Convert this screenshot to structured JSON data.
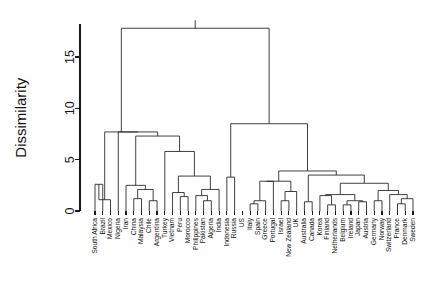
{
  "chart_data": {
    "type": "dendrogram",
    "title": "",
    "xlabel": "",
    "ylabel": "Dissimilarity",
    "ylim": [
      0,
      17.8
    ],
    "yticks": [
      0,
      5,
      10,
      15
    ],
    "ytick_labels": [
      "0",
      "5",
      "10",
      "15"
    ],
    "grid": false,
    "legend": "none",
    "leaf_order": [
      "South Africa",
      "Brazil",
      "Mexico",
      "Nigeria",
      "Iran",
      "China",
      "Malaysia",
      "Chile",
      "Argentina",
      "Turkey",
      "Vietnam",
      "Peru",
      "Morocco",
      "Philippines",
      "Pakistan",
      "Algeria",
      "India",
      "Indonesia",
      "Russia",
      "US",
      "Italy",
      "Spain",
      "Greece",
      "Portugal",
      "Israel",
      "New Zealand",
      "UK",
      "Australia",
      "Canada",
      "Korea",
      "Finland",
      "Netherlands",
      "Belgium",
      "Ireland",
      "Japan",
      "Austria",
      "Germany",
      "Norway",
      "Switzerland",
      "France",
      "Denmark",
      "Sweden"
    ],
    "leaf_count": 42,
    "merges": [
      {
        "id": "m1",
        "left": "South Africa",
        "right": "Brazil",
        "height": 2.6
      },
      {
        "id": "m2",
        "left": "Mexico",
        "right": "m1",
        "height": 1.1
      },
      {
        "id": "m3",
        "left": "China",
        "right": "Malaysia",
        "height": 1.2
      },
      {
        "id": "m4",
        "left": "Chile",
        "right": "Argentina",
        "height": 1.0
      },
      {
        "id": "m5",
        "left": "m3",
        "right": "m4",
        "height": 2.1
      },
      {
        "id": "m6",
        "left": "Iran",
        "right": "m5",
        "height": 2.5
      },
      {
        "id": "m7",
        "left": "Peru",
        "right": "Morocco",
        "height": 1.4
      },
      {
        "id": "m8",
        "left": "Vietnam",
        "right": "m7",
        "height": 1.8
      },
      {
        "id": "m9",
        "left": "Pakistan",
        "right": "Algeria",
        "height": 1.0
      },
      {
        "id": "m10",
        "left": "Philippines",
        "right": "m9",
        "height": 1.5
      },
      {
        "id": "m11",
        "left": "m10",
        "right": "India",
        "height": 2.1
      },
      {
        "id": "m12",
        "left": "m8",
        "right": "m11",
        "height": 3.4
      },
      {
        "id": "m13",
        "left": "Turkey",
        "right": "m12",
        "height": 5.8
      },
      {
        "id": "m14",
        "left": "m6",
        "right": "m13",
        "height": 7.3
      },
      {
        "id": "m15",
        "left": "Nigeria",
        "right": "m14",
        "height": 7.7
      },
      {
        "id": "m16",
        "left": "m2",
        "right": "m15",
        "height": 7.7
      },
      {
        "id": "m17",
        "left": "Indonesia",
        "right": "Russia",
        "height": 3.3
      },
      {
        "id": "m18",
        "left": "Italy",
        "right": "Spain",
        "height": 0.7
      },
      {
        "id": "m19",
        "left": "m18",
        "right": "Greece",
        "height": 1.0
      },
      {
        "id": "m20",
        "left": "m19",
        "right": "Portugal",
        "height": 2.9
      },
      {
        "id": "m21",
        "left": "Israel",
        "right": "New Zealand",
        "height": 1.0
      },
      {
        "id": "m22",
        "left": "m21",
        "right": "UK",
        "height": 1.9
      },
      {
        "id": "m23",
        "left": "m20",
        "right": "m22",
        "height": 2.9
      },
      {
        "id": "m24",
        "left": "Australia",
        "right": "Canada",
        "height": 0.9
      },
      {
        "id": "m25",
        "left": "Finland",
        "right": "Netherlands",
        "height": 0.6
      },
      {
        "id": "m26",
        "left": "Korea",
        "right": "m25",
        "height": 1.5
      },
      {
        "id": "m27",
        "left": "Belgium",
        "right": "Ireland",
        "height": 0.6
      },
      {
        "id": "m28",
        "left": "Japan",
        "right": "Austria",
        "height": 0.9
      },
      {
        "id": "m29",
        "left": "m27",
        "right": "m28",
        "height": 1.0
      },
      {
        "id": "m30",
        "left": "m26",
        "right": "m29",
        "height": 1.6
      },
      {
        "id": "m31",
        "left": "Germany",
        "right": "Norway",
        "height": 1.0
      },
      {
        "id": "m32",
        "left": "France",
        "right": "Denmark",
        "height": 0.7
      },
      {
        "id": "m33",
        "left": "m32",
        "right": "Sweden",
        "height": 1.2
      },
      {
        "id": "m34",
        "left": "Switzerland",
        "right": "m33",
        "height": 1.6
      },
      {
        "id": "m35",
        "left": "m31",
        "right": "m34",
        "height": 2.0
      },
      {
        "id": "m36",
        "left": "m30",
        "right": "m35",
        "height": 2.7
      },
      {
        "id": "m37",
        "left": "m24",
        "right": "m36",
        "height": 3.5
      },
      {
        "id": "m38",
        "left": "m23",
        "right": "m37",
        "height": 3.9
      },
      {
        "id": "m39",
        "left": "m17",
        "right": "m38",
        "height": 8.5
      },
      {
        "id": "m40",
        "left": "m16",
        "right": "m39",
        "height": 17.8
      }
    ]
  }
}
